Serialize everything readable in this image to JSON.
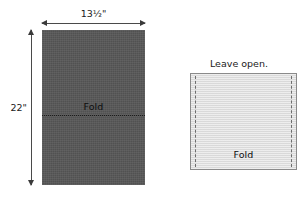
{
  "figure": {
    "colors": {
      "fabric_dark": "#575757",
      "fabric_light": "#dcdcdc",
      "line": "#4a4a4a",
      "stitch": "#6d6d6d",
      "text": "#1a1a1a",
      "background": "#ffffff"
    },
    "left_panel": {
      "name": "cut-piece",
      "width_dimension_label": "13½\"",
      "height_dimension_label": "22\"",
      "fold_label": "Fold",
      "fold_line_style": "dotted"
    },
    "right_panel": {
      "name": "folded-sewn-piece",
      "top_label": "Leave open.",
      "fold_label": "Fold",
      "stitch_line_style": "dashed",
      "stitch_sides": [
        "left",
        "right"
      ]
    }
  }
}
